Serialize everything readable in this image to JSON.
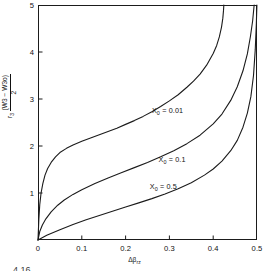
{
  "figure": {
    "caption_fragment": "4.16",
    "background_color": "#ffffff",
    "line_color": "#1b1b1b"
  },
  "chart_data": {
    "type": "line",
    "title": "",
    "xlabel": "Δβrz",
    "xlabel_base": "Δβ",
    "xlabel_sub": "rz",
    "ylabel": "r3 (W3 − W3o) / 2",
    "ylabel_prefix": "r",
    "ylabel_prefix_sub": "3",
    "ylabel_numerator": "(W3 − W3o)",
    "ylabel_denominator": "2",
    "xlim": [
      0,
      0.5
    ],
    "ylim": [
      0,
      5
    ],
    "xticks": [
      0,
      0.1,
      0.2,
      0.3,
      0.4,
      0.5
    ],
    "xticklabels": [
      "0",
      "0.1",
      "0.2",
      "0.3",
      "0.4",
      "0.5"
    ],
    "yticks": [
      1,
      2,
      3,
      4,
      5
    ],
    "yticklabels": [
      "1",
      "2",
      "3",
      "4",
      "5"
    ],
    "grid": false,
    "legend": "inline annotations",
    "series": [
      {
        "name": "X0 = 0.01",
        "label_base": "X",
        "label_sub": "0",
        "label_value": " = 0.01",
        "asymptote_x": 0.425,
        "points": [
          [
            0.0,
            0.0
          ],
          [
            0.002,
            0.45
          ],
          [
            0.004,
            0.75
          ],
          [
            0.007,
            1.0
          ],
          [
            0.011,
            1.2
          ],
          [
            0.016,
            1.38
          ],
          [
            0.022,
            1.52
          ],
          [
            0.03,
            1.65
          ],
          [
            0.04,
            1.77
          ],
          [
            0.05,
            1.86
          ],
          [
            0.065,
            1.95
          ],
          [
            0.08,
            2.02
          ],
          [
            0.1,
            2.1
          ],
          [
            0.12,
            2.17
          ],
          [
            0.14,
            2.24
          ],
          [
            0.16,
            2.31
          ],
          [
            0.18,
            2.38
          ],
          [
            0.2,
            2.46
          ],
          [
            0.22,
            2.54
          ],
          [
            0.24,
            2.63
          ],
          [
            0.26,
            2.73
          ],
          [
            0.28,
            2.84
          ],
          [
            0.3,
            2.96
          ],
          [
            0.32,
            3.09
          ],
          [
            0.34,
            3.25
          ],
          [
            0.355,
            3.38
          ],
          [
            0.37,
            3.53
          ],
          [
            0.385,
            3.72
          ],
          [
            0.4,
            3.97
          ],
          [
            0.408,
            4.14
          ],
          [
            0.414,
            4.32
          ],
          [
            0.419,
            4.53
          ],
          [
            0.422,
            4.72
          ],
          [
            0.4235,
            4.88
          ],
          [
            0.4243,
            5.0
          ]
        ]
      },
      {
        "name": "X0 = 0.1",
        "label_base": "X",
        "label_sub": "0",
        "label_value": " = 0.1",
        "asymptote_x": 0.495,
        "points": [
          [
            0.0,
            0.0
          ],
          [
            0.004,
            0.18
          ],
          [
            0.01,
            0.32
          ],
          [
            0.018,
            0.45
          ],
          [
            0.03,
            0.6
          ],
          [
            0.045,
            0.74
          ],
          [
            0.06,
            0.85
          ],
          [
            0.08,
            0.97
          ],
          [
            0.1,
            1.07
          ],
          [
            0.13,
            1.2
          ],
          [
            0.16,
            1.32
          ],
          [
            0.19,
            1.43
          ],
          [
            0.22,
            1.54
          ],
          [
            0.25,
            1.65
          ],
          [
            0.28,
            1.77
          ],
          [
            0.31,
            1.9
          ],
          [
            0.34,
            2.05
          ],
          [
            0.37,
            2.23
          ],
          [
            0.4,
            2.47
          ],
          [
            0.42,
            2.68
          ],
          [
            0.44,
            2.97
          ],
          [
            0.455,
            3.26
          ],
          [
            0.468,
            3.6
          ],
          [
            0.478,
            3.96
          ],
          [
            0.485,
            4.33
          ],
          [
            0.49,
            4.66
          ],
          [
            0.4935,
            5.0
          ]
        ]
      },
      {
        "name": "X0 = 0.5",
        "label_base": "X",
        "label_sub": "0",
        "label_value": " = 0.5",
        "asymptote_x": 0.5,
        "points": [
          [
            0.0,
            0.0
          ],
          [
            0.02,
            0.1
          ],
          [
            0.05,
            0.22
          ],
          [
            0.08,
            0.33
          ],
          [
            0.11,
            0.43
          ],
          [
            0.14,
            0.52
          ],
          [
            0.17,
            0.61
          ],
          [
            0.2,
            0.7
          ],
          [
            0.23,
            0.79
          ],
          [
            0.26,
            0.88
          ],
          [
            0.29,
            0.98
          ],
          [
            0.32,
            1.09
          ],
          [
            0.35,
            1.22
          ],
          [
            0.38,
            1.38
          ],
          [
            0.4,
            1.51
          ],
          [
            0.42,
            1.68
          ],
          [
            0.44,
            1.9
          ],
          [
            0.455,
            2.12
          ],
          [
            0.468,
            2.4
          ],
          [
            0.478,
            2.7
          ],
          [
            0.486,
            3.05
          ],
          [
            0.492,
            3.5
          ],
          [
            0.496,
            4.05
          ],
          [
            0.4985,
            4.6
          ],
          [
            0.4998,
            5.0
          ]
        ]
      }
    ],
    "annotations": [
      {
        "text": "X0 = 0.01",
        "x": 0.26,
        "y": 2.75
      },
      {
        "text": "X0 = 0.1",
        "x": 0.275,
        "y": 1.7
      },
      {
        "text": "X0 = 0.5",
        "x": 0.255,
        "y": 1.12
      }
    ]
  }
}
